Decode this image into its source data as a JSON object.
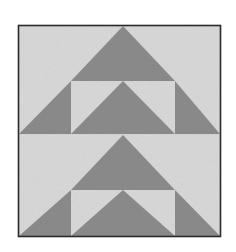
{
  "image": {
    "subject": "quilt-block",
    "pattern": "flying geese triangles",
    "colors": {
      "background": "#ffffff",
      "fabric_light": "#d9d9d9",
      "fabric_dark": "#8c8c8c",
      "border": "#2a2a2a"
    },
    "frame": {
      "x": 18,
      "y": 25,
      "width": 203,
      "height": 212
    }
  }
}
